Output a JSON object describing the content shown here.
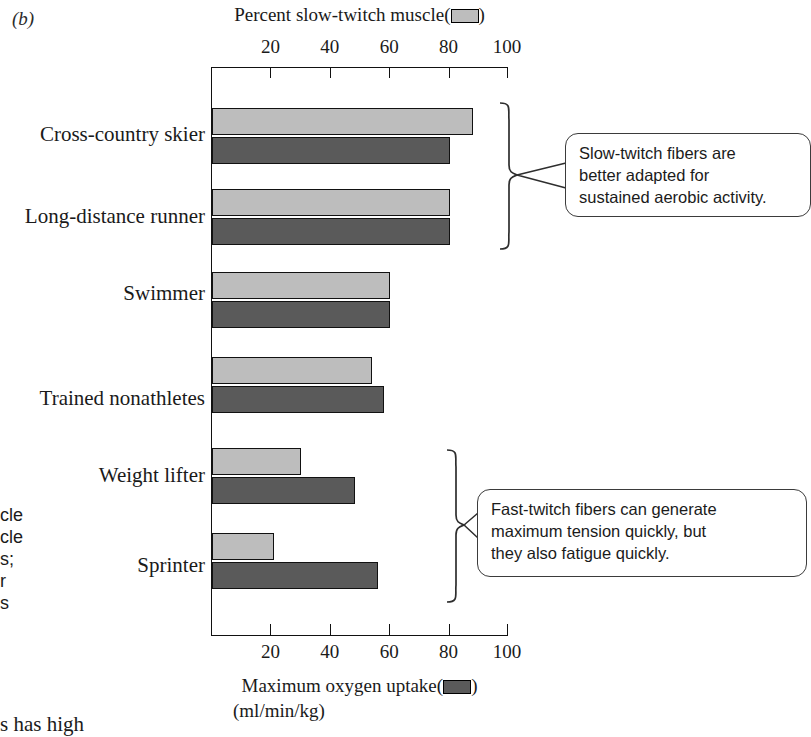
{
  "panel": {
    "letter": "(b)"
  },
  "chart_data": {
    "type": "bar",
    "orientation": "horizontal",
    "title": "",
    "categories": [
      "Cross-country skier",
      "Long-distance runner",
      "Swimmer",
      "Trained nonathletes",
      "Weight lifter",
      "Sprinter"
    ],
    "series": [
      {
        "name": "Percent slow-twitch muscle",
        "color": "#bdbdbd",
        "axis": "top",
        "values": [
          88,
          80,
          60,
          54,
          30,
          21
        ]
      },
      {
        "name": "Maximum oxygen uptake (ml/min/kg)",
        "color": "#5a5a5a",
        "axis": "bottom",
        "values": [
          80,
          80,
          60,
          58,
          48,
          56
        ]
      }
    ],
    "top_axis": {
      "label": "Percent slow-twitch muscle",
      "label_suffix": "",
      "ticks": [
        20,
        40,
        60,
        80,
        100
      ],
      "tick_labels": [
        "20",
        "40",
        "60",
        "80",
        "100"
      ],
      "range": [
        0,
        100
      ],
      "legend_swatch": "light-gray-swatch"
    },
    "bottom_axis": {
      "label": "Maximum oxygen uptake",
      "units": "(ml/min/kg)",
      "ticks": [
        20,
        40,
        60,
        80,
        100
      ],
      "tick_labels": [
        "20",
        "40",
        "60",
        "80",
        "100"
      ],
      "range": [
        0,
        100
      ],
      "legend_swatch": "dark-gray-swatch"
    },
    "grid": false,
    "legend_position": "axis-titles"
  },
  "callouts": [
    {
      "id": "slow-twitch",
      "text": "Slow-twitch fibers are better adapted for sustained aerobic activity.",
      "lines": [
        "Slow-twitch fibers are",
        "better adapted for",
        "sustained aerobic activity."
      ],
      "brace_covers": [
        "Cross-country skier",
        "Long-distance runner"
      ]
    },
    {
      "id": "fast-twitch",
      "text": "Fast-twitch fibers can generate maximum tension quickly, but they also fatigue quickly.",
      "lines": [
        "Fast-twitch fibers can generate",
        "maximum tension quickly, but",
        "they also fatigue quickly."
      ],
      "brace_covers": [
        "Weight lifter",
        "Sprinter"
      ]
    }
  ],
  "cropped_caption_fragments": {
    "left_lines": [
      "cle",
      "cle",
      "s;",
      "r",
      "s"
    ],
    "bottom_line": "s has high"
  },
  "colors": {
    "slow_twitch_bar": "#bdbdbd",
    "max_oxygen_bar": "#5a5a5a",
    "axis": "#111111",
    "callout_border": "#3b3b3b",
    "background": "#ffffff"
  }
}
